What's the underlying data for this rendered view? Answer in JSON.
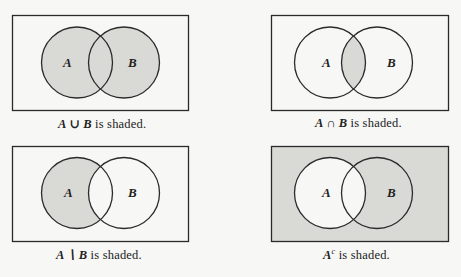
{
  "colors": {
    "shade": "#d9d9d6",
    "paper": "#f7f7f5",
    "stroke": "#2a2a2a"
  },
  "labels": {
    "a": "A",
    "b": "B"
  },
  "panels": [
    {
      "id": "union",
      "caption_set": "A ∪ B",
      "caption_text": "is shaded.",
      "shaded_region": "A union B"
    },
    {
      "id": "intersection",
      "caption_set": "A ∩ B",
      "caption_text": "is shaded.",
      "shaded_region": "A intersect B"
    },
    {
      "id": "difference",
      "caption_set": "A ∖ B",
      "caption_text": "is shaded.",
      "shaded_region": "A minus B"
    },
    {
      "id": "complement",
      "caption_set": "A",
      "caption_sup": "c",
      "caption_text": "is shaded.",
      "shaded_region": "complement of A"
    }
  ]
}
